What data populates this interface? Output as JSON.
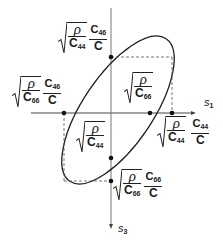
{
  "diagram": {
    "type": "slowness-curve-ellipse",
    "colors": {
      "line": "#222222",
      "axis": "#555555",
      "dash": "#444444",
      "background": "#ffffff"
    },
    "axes": {
      "horizontal": {
        "label": "s",
        "subscript": "1"
      },
      "vertical": {
        "label": "s",
        "subscript": "3"
      }
    },
    "labels": {
      "top_left": {
        "rho": "ρ",
        "den1": "C",
        "den1_sub": "44",
        "num2": "C",
        "num2_sub": "46",
        "den2": "C"
      },
      "left": {
        "rho": "ρ",
        "den1": "C",
        "den1_sub": "66",
        "num2": "C",
        "num2_sub": "46",
        "den2": "C"
      },
      "inner_upper": {
        "rho": "ρ",
        "den1": "C",
        "den1_sub": "66"
      },
      "inner_lower": {
        "rho": "ρ",
        "den1": "C",
        "den1_sub": "44"
      },
      "right": {
        "rho": "ρ",
        "den1": "C",
        "den1_sub": "44",
        "num2": "C",
        "num2_sub": "44",
        "den2": "C"
      },
      "bottom": {
        "rho": "ρ",
        "den1": "C",
        "den1_sub": "66",
        "num2": "C",
        "num2_sub": "66",
        "den2": "C"
      }
    },
    "points": [
      {
        "name": "s3-upper-extreme",
        "x": 111,
        "y": 57
      },
      {
        "name": "s1-left-intercept",
        "x": 64,
        "y": 113
      },
      {
        "name": "s1-right-intercept",
        "x": 150,
        "y": 113
      },
      {
        "name": "s1-right-extreme",
        "x": 172,
        "y": 113
      },
      {
        "name": "s3-lower-intercept",
        "x": 111,
        "y": 158
      },
      {
        "name": "s3-lower-extreme",
        "x": 111,
        "y": 181
      }
    ]
  }
}
